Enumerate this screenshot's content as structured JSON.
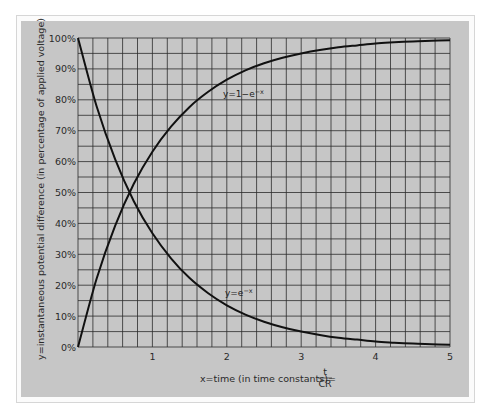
{
  "chart_data": {
    "type": "line",
    "title": "",
    "xlabel": "x=time (in time constants)=",
    "xlabel_fraction": {
      "numerator": "t",
      "denominator": "CR"
    },
    "ylabel": "y=instantaneous potential difference (in percentage of applied voltage)",
    "xlim": [
      0,
      5
    ],
    "ylim": [
      0,
      100
    ],
    "grid": true,
    "grid_x_step": 0.2,
    "grid_y_step": 5,
    "x_ticks": [
      "1",
      "2",
      "3",
      "4",
      "5"
    ],
    "y_ticks": [
      "0%",
      "10%",
      "20%",
      "30%",
      "40%",
      "50%",
      "60%",
      "70%",
      "80%",
      "90%",
      "100%"
    ],
    "x": [
      0,
      0.25,
      0.5,
      0.75,
      1,
      1.25,
      1.5,
      1.75,
      2,
      2.25,
      2.5,
      2.75,
      3,
      3.25,
      3.5,
      3.75,
      4,
      4.25,
      4.5,
      4.75,
      5
    ],
    "series": [
      {
        "name": "y=1-e^-x",
        "label": "y=1−e",
        "label_sup": "−x",
        "values": [
          0,
          22.1,
          39.3,
          52.8,
          63.2,
          71.3,
          77.7,
          82.6,
          86.5,
          89.5,
          91.8,
          93.6,
          95.0,
          96.1,
          97.0,
          97.6,
          98.2,
          98.6,
          98.9,
          99.1,
          99.3
        ]
      },
      {
        "name": "y=e^-x",
        "label": "y=e",
        "label_sup": "−x",
        "values": [
          100,
          77.9,
          60.7,
          47.2,
          36.8,
          28.7,
          22.3,
          17.4,
          13.5,
          10.5,
          8.2,
          6.4,
          5.0,
          3.9,
          3.0,
          2.4,
          1.8,
          1.4,
          1.1,
          0.9,
          0.7
        ]
      }
    ]
  }
}
